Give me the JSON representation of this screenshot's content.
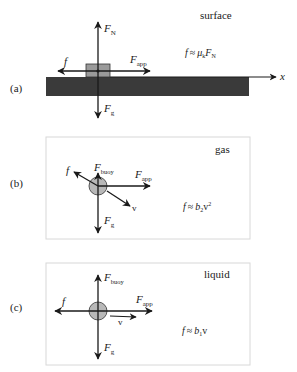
{
  "colors": {
    "arrow": "#1a1a1a",
    "ground": "#3a3a3a",
    "block": "#9a9a9a",
    "ball": "#b8b8b8",
    "panel_border": "#d8d8d8"
  },
  "panels": [
    {
      "id": "a",
      "label": "(a)",
      "medium": "surface",
      "formula": {
        "lhs": "f",
        "approx": "≈",
        "coef": "μ",
        "coef_sub": "k",
        "var": "F",
        "var_sub": "N",
        "power": ""
      },
      "forces": {
        "normal": {
          "main": "F",
          "sub": "N"
        },
        "gravity": {
          "main": "F",
          "sub": "g"
        },
        "applied": {
          "main": "F",
          "sub": "app"
        },
        "friction": {
          "main": "f"
        }
      },
      "axis_label": "x"
    },
    {
      "id": "b",
      "label": "(b)",
      "medium": "gas",
      "formula": {
        "lhs": "f",
        "approx": "≈",
        "coef": "b",
        "coef_sub": "2",
        "var": "v",
        "power": "2"
      },
      "forces": {
        "buoyancy": {
          "main": "F",
          "sub": "buoy"
        },
        "gravity": {
          "main": "F",
          "sub": "g"
        },
        "applied": {
          "main": "F",
          "sub": "app"
        },
        "friction": {
          "main": "f"
        },
        "velocity": {
          "main": "v"
        }
      }
    },
    {
      "id": "c",
      "label": "(c)",
      "medium": "liquid",
      "formula": {
        "lhs": "f",
        "approx": "≈",
        "coef": "b",
        "coef_sub": "1",
        "var": "v",
        "power": ""
      },
      "forces": {
        "buoyancy": {
          "main": "F",
          "sub": "buoy"
        },
        "gravity": {
          "main": "F",
          "sub": "g"
        },
        "applied": {
          "main": "F",
          "sub": "app"
        },
        "friction": {
          "main": "f"
        },
        "velocity": {
          "main": "v"
        }
      }
    }
  ]
}
